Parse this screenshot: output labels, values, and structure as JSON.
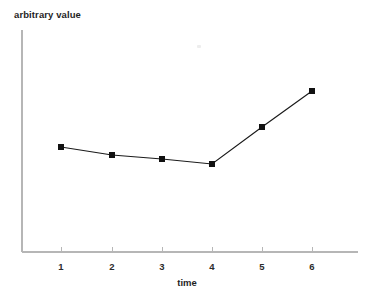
{
  "chart_data": {
    "type": "line",
    "title": "",
    "xlabel": "time",
    "ylabel": "arbitrary value",
    "x": [
      1,
      2,
      3,
      4,
      5,
      6
    ],
    "xtick_labels": [
      "1",
      "2",
      "3",
      "4",
      "5",
      "6"
    ],
    "values": [
      0.56,
      0.48,
      0.44,
      0.39,
      0.74,
      1.07
    ],
    "series": [
      {
        "name": "arbitrary value",
        "values": [
          0.56,
          0.48,
          0.44,
          0.39,
          0.74,
          1.07
        ]
      }
    ],
    "xlim": [
      0.3,
      6.9
    ],
    "ylim": [
      0.0,
      1.45
    ],
    "grid": false,
    "legend": "none",
    "marker": "filled-square",
    "line_color": "#111111",
    "marker_color": "#111111",
    "axis_color": "#b6b6b6",
    "background_color": "#ffffff",
    "yticks_visible": false,
    "ytick_labels": [],
    "annotations": []
  },
  "axes": {
    "y_axis_label": "arbitrary value",
    "x_axis_label": "time"
  },
  "geometry": {
    "width": 372,
    "height": 297,
    "x_axis_y": 252,
    "y_axis_x": 22,
    "y_axis_top": 30,
    "x_axis_right": 358,
    "tick_length": 5,
    "marker_size": 6,
    "points_px": [
      {
        "label": "1",
        "x": 61,
        "y": 147
      },
      {
        "label": "2",
        "x": 112,
        "y": 155
      },
      {
        "label": "3",
        "x": 162,
        "y": 159
      },
      {
        "label": "4",
        "x": 212,
        "y": 164
      },
      {
        "label": "5",
        "x": 262,
        "y": 127
      },
      {
        "label": "6",
        "x": 312,
        "y": 91
      }
    ],
    "tick_label_y": 270,
    "xlabel_x": 187,
    "xlabel_y": 286
  }
}
